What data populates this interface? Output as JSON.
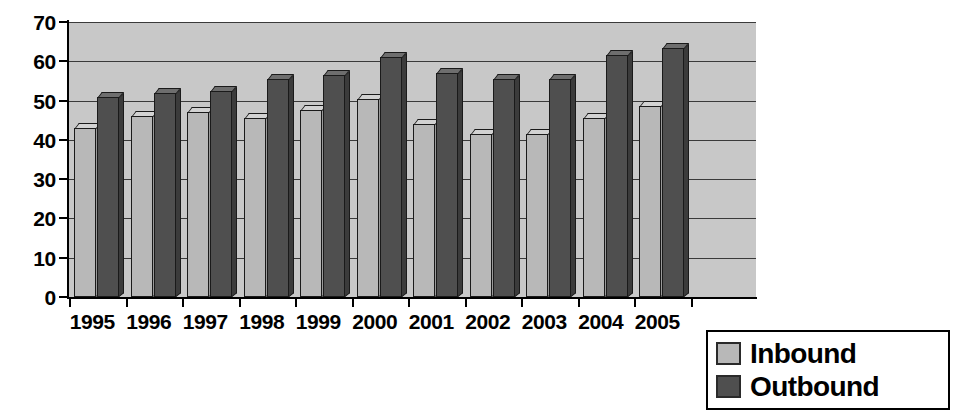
{
  "chart_data": {
    "type": "bar",
    "title": "",
    "subtitle": "",
    "xlabel": "",
    "ylabel": "",
    "categories": [
      "1995",
      "1996",
      "1997",
      "1998",
      "1999",
      "2000",
      "2001",
      "2002",
      "2003",
      "2004",
      "2005"
    ],
    "series": [
      {
        "name": "Inbound",
        "color": "#b8b8b8",
        "values": [
          43,
          46,
          47,
          45.5,
          47.5,
          50.5,
          44,
          41.5,
          41.5,
          45.5,
          48.5
        ]
      },
      {
        "name": "Outbound",
        "color": "#4f4f4f",
        "values": [
          51,
          52,
          52.5,
          55.5,
          56.5,
          61,
          57,
          55.5,
          55.5,
          61.5,
          63.5
        ]
      }
    ],
    "ylim": [
      0,
      70
    ],
    "ytick_values": [
      0,
      10,
      20,
      30,
      40,
      50,
      60,
      70
    ],
    "ytick_labels": [
      "0",
      "10",
      "20",
      "30",
      "40",
      "50",
      "60",
      "70"
    ],
    "grid": true,
    "grid_axis": "y",
    "legend_position": "bottom-right",
    "plot_background": "#c8c8c8"
  },
  "legend": {
    "items": [
      {
        "label": "Inbound",
        "color": "#b8b8b8"
      },
      {
        "label": "Outbound",
        "color": "#4f4f4f"
      }
    ]
  }
}
